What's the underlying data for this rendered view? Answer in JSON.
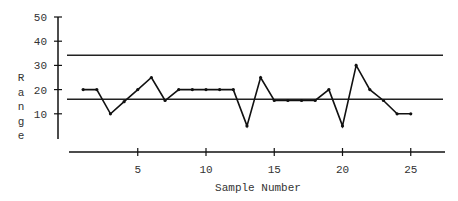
{
  "chart_data": {
    "type": "line",
    "title": "",
    "xlabel": "Sample Number",
    "ylabel": "Range",
    "ylabel_letters": [
      "R",
      "a",
      "n",
      "g",
      "e"
    ],
    "x": [
      1,
      2,
      3,
      4,
      5,
      6,
      7,
      8,
      9,
      10,
      11,
      12,
      13,
      14,
      15,
      16,
      17,
      18,
      19,
      20,
      21,
      22,
      23,
      24,
      25
    ],
    "series": [
      {
        "name": "Range",
        "values": [
          20,
          20,
          10,
          15,
          20,
          25,
          15.5,
          20,
          20,
          20,
          20,
          20,
          5,
          25,
          15.5,
          15.5,
          15.5,
          15.5,
          20,
          5,
          30,
          20,
          15.5,
          10,
          10
        ]
      }
    ],
    "reference_lines": [
      {
        "name": "UCL",
        "value": 34.2
      },
      {
        "name": "Center Line",
        "value": 16
      }
    ],
    "x_ticks": [
      5,
      10,
      15,
      20,
      25
    ],
    "y_ticks": [
      10,
      20,
      30,
      40,
      50
    ],
    "ylim": [
      0,
      50
    ],
    "xlim": [
      0,
      27
    ],
    "grid": false,
    "legend": "none"
  }
}
